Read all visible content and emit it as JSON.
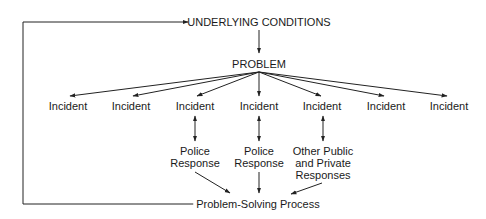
{
  "diagram": {
    "type": "flow",
    "nodes": {
      "underlying_conditions": "UNDERLYING CONDITIONS",
      "problem": "PROBLEM",
      "incidents": [
        "Incident",
        "Incident",
        "Incident",
        "Incident",
        "Incident",
        "Incident",
        "Incident"
      ],
      "responses": [
        {
          "line1": "Police",
          "line2": "Response",
          "line3": ""
        },
        {
          "line1": "Police",
          "line2": "Response",
          "line3": ""
        },
        {
          "line1": "Other Public",
          "line2": "and Private",
          "line3": "Responses"
        }
      ],
      "process": "Problem-Solving Process"
    },
    "edges": [
      {
        "from": "UNDERLYING CONDITIONS",
        "to": "PROBLEM"
      },
      {
        "from": "PROBLEM",
        "to": "Incident (x7)"
      },
      {
        "from": "Incident 3",
        "to": "Police Response",
        "bidirectional": true
      },
      {
        "from": "Incident 4",
        "to": "Police Response",
        "bidirectional": true
      },
      {
        "from": "Incident 5",
        "to": "Other Public and Private Responses",
        "bidirectional": true
      },
      {
        "from": "Responses",
        "to": "Problem-Solving Process"
      },
      {
        "from": "Problem-Solving Process",
        "to": "UNDERLYING CONDITIONS",
        "feedback_loop": true
      }
    ],
    "line_color": "#222222"
  }
}
